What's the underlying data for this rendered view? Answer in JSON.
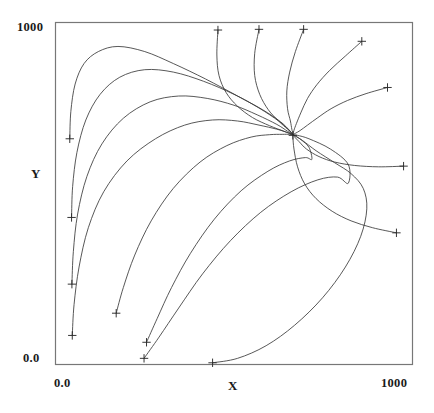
{
  "figure": {
    "background": "#ffffff",
    "line_color": "#3a3a3a",
    "frame_color": "#777777",
    "marker_color": "#2a2a2a"
  },
  "axes": {
    "x_title": "X",
    "y_title": "Y",
    "x_tick_min": "0.0",
    "x_tick_max": "1000",
    "y_tick_min": "0.0",
    "y_tick_max": "1000"
  },
  "chart_data": {
    "type": "line",
    "title": "",
    "xlabel": "X",
    "ylabel": "Y",
    "xlim": [
      0,
      1000
    ],
    "ylim": [
      0,
      1000
    ],
    "xticks": [
      0,
      1000
    ],
    "xticklabels": [
      "0.0",
      "1000"
    ],
    "yticks": [
      0,
      1000
    ],
    "yticklabels": [
      "0.0",
      "1000"
    ],
    "grid": false,
    "legend": null,
    "fixed_point": {
      "x": 665,
      "y": 670,
      "marker": "plus"
    },
    "marker_style": "plus",
    "series": [
      {
        "name": "trajectory-1",
        "start": [
          40,
          660
        ],
        "points": [
          [
            40,
            660
          ],
          [
            43,
            740
          ],
          [
            55,
            820
          ],
          [
            80,
            880
          ],
          [
            120,
            915
          ],
          [
            175,
            930
          ],
          [
            250,
            915
          ],
          [
            330,
            880
          ],
          [
            420,
            835
          ],
          [
            510,
            785
          ],
          [
            580,
            745
          ],
          [
            630,
            710
          ],
          [
            655,
            685
          ],
          [
            665,
            672
          ]
        ]
      },
      {
        "name": "trajectory-2",
        "start": [
          45,
          430
        ],
        "points": [
          [
            45,
            430
          ],
          [
            48,
            520
          ],
          [
            60,
            620
          ],
          [
            85,
            715
          ],
          [
            125,
            790
          ],
          [
            180,
            840
          ],
          [
            250,
            862
          ],
          [
            330,
            855
          ],
          [
            415,
            828
          ],
          [
            500,
            790
          ],
          [
            570,
            750
          ],
          [
            625,
            712
          ],
          [
            652,
            688
          ],
          [
            665,
            672
          ]
        ]
      },
      {
        "name": "trajectory-3",
        "start": [
          46,
          235
        ],
        "points": [
          [
            46,
            235
          ],
          [
            50,
            330
          ],
          [
            62,
            440
          ],
          [
            88,
            550
          ],
          [
            130,
            645
          ],
          [
            190,
            720
          ],
          [
            265,
            768
          ],
          [
            345,
            785
          ],
          [
            425,
            778
          ],
          [
            500,
            758
          ],
          [
            565,
            730
          ],
          [
            620,
            702
          ],
          [
            650,
            682
          ],
          [
            665,
            672
          ]
        ]
      },
      {
        "name": "trajectory-4",
        "start": [
          47,
          85
        ],
        "points": [
          [
            47,
            85
          ],
          [
            52,
            175
          ],
          [
            66,
            285
          ],
          [
            92,
            400
          ],
          [
            135,
            505
          ],
          [
            200,
            595
          ],
          [
            280,
            660
          ],
          [
            362,
            700
          ],
          [
            440,
            715
          ],
          [
            510,
            712
          ],
          [
            570,
            700
          ],
          [
            620,
            688
          ],
          [
            650,
            678
          ],
          [
            665,
            672
          ]
        ]
      },
      {
        "name": "trajectory-5",
        "start": [
          170,
          150
        ],
        "points": [
          [
            170,
            150
          ],
          [
            190,
            225
          ],
          [
            222,
            320
          ],
          [
            268,
            420
          ],
          [
            330,
            515
          ],
          [
            405,
            592
          ],
          [
            480,
            640
          ],
          [
            548,
            665
          ],
          [
            600,
            672
          ],
          [
            635,
            673
          ],
          [
            655,
            673
          ],
          [
            665,
            672
          ]
        ]
      },
      {
        "name": "trajectory-6",
        "start": [
          255,
          65
        ],
        "points": [
          [
            255,
            65
          ],
          [
            285,
            135
          ],
          [
            325,
            225
          ],
          [
            378,
            325
          ],
          [
            445,
            425
          ],
          [
            520,
            508
          ],
          [
            595,
            565
          ],
          [
            655,
            595
          ],
          [
            700,
            605
          ],
          [
            718,
            600
          ],
          [
            710,
            635
          ],
          [
            688,
            657
          ],
          [
            672,
            668
          ],
          [
            665,
            672
          ]
        ]
      },
      {
        "name": "trajectory-7",
        "start": [
          248,
          18
        ],
        "points": [
          [
            248,
            18
          ],
          [
            290,
            80
          ],
          [
            345,
            165
          ],
          [
            412,
            265
          ],
          [
            490,
            362
          ],
          [
            575,
            445
          ],
          [
            660,
            505
          ],
          [
            735,
            540
          ],
          [
            790,
            548
          ],
          [
            820,
            530
          ],
          [
            820,
            585
          ],
          [
            770,
            630
          ],
          [
            710,
            660
          ],
          [
            678,
            670
          ],
          [
            665,
            672
          ]
        ]
      },
      {
        "name": "trajectory-8",
        "start": [
          440,
          5
        ],
        "points": [
          [
            440,
            5
          ],
          [
            510,
            18
          ],
          [
            590,
            55
          ],
          [
            670,
            115
          ],
          [
            748,
            195
          ],
          [
            812,
            285
          ],
          [
            855,
            375
          ],
          [
            872,
            455
          ],
          [
            862,
            515
          ],
          [
            828,
            558
          ],
          [
            782,
            590
          ],
          [
            730,
            625
          ],
          [
            692,
            655
          ],
          [
            672,
            668
          ],
          [
            665,
            672
          ]
        ]
      },
      {
        "name": "trajectory-9",
        "start": [
          455,
          978
        ],
        "points": [
          [
            455,
            978
          ],
          [
            452,
            905
          ],
          [
            458,
            845
          ],
          [
            478,
            795
          ],
          [
            510,
            755
          ],
          [
            552,
            722
          ],
          [
            600,
            698
          ],
          [
            640,
            682
          ],
          [
            660,
            674
          ],
          [
            665,
            672
          ]
        ]
      },
      {
        "name": "trajectory-10",
        "start": [
          570,
          980
        ],
        "points": [
          [
            570,
            980
          ],
          [
            558,
            910
          ],
          [
            558,
            845
          ],
          [
            572,
            790
          ],
          [
            596,
            745
          ],
          [
            625,
            712
          ],
          [
            650,
            688
          ],
          [
            662,
            676
          ],
          [
            665,
            672
          ]
        ]
      },
      {
        "name": "trajectory-11",
        "start": [
          695,
          980
        ],
        "points": [
          [
            695,
            980
          ],
          [
            672,
            915
          ],
          [
            656,
            855
          ],
          [
            648,
            800
          ],
          [
            650,
            748
          ],
          [
            658,
            712
          ],
          [
            662,
            688
          ],
          [
            665,
            676
          ],
          [
            665,
            672
          ]
        ]
      },
      {
        "name": "trajectory-12",
        "start": [
          858,
          945
        ],
        "points": [
          [
            858,
            945
          ],
          [
            812,
            902
          ],
          [
            768,
            860
          ],
          [
            732,
            818
          ],
          [
            706,
            778
          ],
          [
            688,
            738
          ],
          [
            675,
            705
          ],
          [
            668,
            685
          ],
          [
            665,
            672
          ]
        ]
      },
      {
        "name": "trajectory-13",
        "start": [
          930,
          810
        ],
        "points": [
          [
            930,
            810
          ],
          [
            870,
            792
          ],
          [
            818,
            772
          ],
          [
            772,
            748
          ],
          [
            735,
            722
          ],
          [
            706,
            700
          ],
          [
            685,
            684
          ],
          [
            672,
            676
          ],
          [
            665,
            672
          ]
        ]
      },
      {
        "name": "trajectory-14",
        "start": [
          975,
          580
        ],
        "points": [
          [
            975,
            580
          ],
          [
            905,
            578
          ],
          [
            838,
            582
          ],
          [
            782,
            592
          ],
          [
            738,
            608
          ],
          [
            703,
            630
          ],
          [
            682,
            652
          ],
          [
            670,
            665
          ],
          [
            665,
            672
          ]
        ]
      },
      {
        "name": "trajectory-15",
        "start": [
          955,
          385
        ],
        "points": [
          [
            955,
            385
          ],
          [
            888,
            400
          ],
          [
            828,
            420
          ],
          [
            775,
            448
          ],
          [
            730,
            485
          ],
          [
            698,
            528
          ],
          [
            678,
            578
          ],
          [
            668,
            630
          ],
          [
            665,
            665
          ],
          [
            665,
            672
          ]
        ]
      }
    ]
  }
}
